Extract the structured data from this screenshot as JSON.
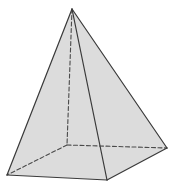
{
  "diagram": {
    "shape": "square-pyramid",
    "colors": {
      "fill": "#dcdcdc",
      "stroke": "#3a3a3a",
      "hidden_stroke": "#4a4a4a",
      "background": "#ffffff"
    },
    "vertices": {
      "apex": [
        72,
        9
      ],
      "front_left": [
        7,
        175
      ],
      "front_right": [
        107,
        180
      ],
      "back_right": [
        167,
        148
      ],
      "back_left": [
        67,
        145
      ]
    },
    "visible_edges": [
      [
        "apex",
        "front_left"
      ],
      [
        "apex",
        "front_right"
      ],
      [
        "apex",
        "back_right"
      ],
      [
        "front_left",
        "front_right"
      ],
      [
        "front_right",
        "back_right"
      ]
    ],
    "hidden_edges": [
      [
        "apex",
        "back_left"
      ],
      [
        "back_left",
        "front_left"
      ],
      [
        "back_left",
        "back_right"
      ]
    ]
  }
}
